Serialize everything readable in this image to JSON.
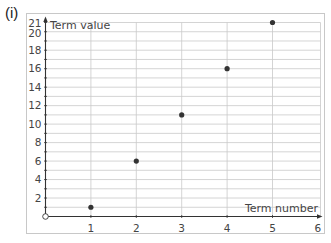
{
  "part_label": "(i)",
  "colors": {
    "frame": "#c8c8c8",
    "grid": "#c9c9c9",
    "axis": "#333333",
    "point": "#333333",
    "text": "#444444"
  },
  "chart_data": {
    "type": "scatter",
    "title": "",
    "xlabel": "Term number",
    "ylabel": "Term value",
    "xlim": [
      0,
      6
    ],
    "ylim": [
      0,
      21
    ],
    "x_ticks": [
      1,
      2,
      3,
      4,
      5,
      6
    ],
    "y_ticks": [
      2,
      4,
      6,
      8,
      10,
      12,
      14,
      16,
      18,
      20,
      21
    ],
    "origin_marker": "open-circle",
    "grid": {
      "vertical_every": 1,
      "horizontal_every": 1
    },
    "series": [
      {
        "name": "Term values",
        "points": [
          {
            "x": 1,
            "y": 1
          },
          {
            "x": 2,
            "y": 6
          },
          {
            "x": 3,
            "y": 11
          },
          {
            "x": 4,
            "y": 16
          },
          {
            "x": 5,
            "y": 21
          }
        ]
      }
    ]
  }
}
